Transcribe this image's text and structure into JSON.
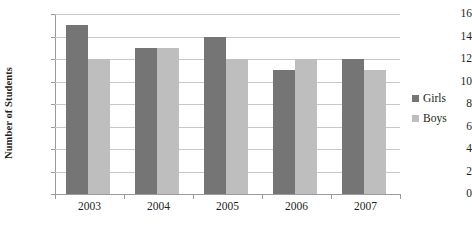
{
  "chart_data": {
    "type": "bar",
    "title": "",
    "xlabel": "",
    "ylabel": "Number of Students",
    "categories": [
      "2003",
      "2004",
      "2005",
      "2006",
      "2007"
    ],
    "series": [
      {
        "name": "Girls",
        "color": "#757575",
        "values": [
          15,
          13,
          14,
          11,
          12
        ]
      },
      {
        "name": "Boys",
        "color": "#bebebe",
        "values": [
          12,
          13,
          12,
          12,
          11
        ]
      }
    ],
    "ylim": [
      0,
      16
    ],
    "ytick_step": 2,
    "yticks": [
      "0",
      "2",
      "4",
      "6",
      "8",
      "10",
      "12",
      "14",
      "16"
    ],
    "grid": true,
    "legend_position": "right"
  },
  "legend": {
    "entries": [
      {
        "label": "Girls",
        "color": "#757575"
      },
      {
        "label": "Boys",
        "color": "#bebebe"
      }
    ]
  },
  "colors": {
    "girls": "#757575",
    "boys": "#bebebe",
    "gridline": "#c8c8c8",
    "axis": "#9a9a9a",
    "background": "#ffffff",
    "text": "#231f20"
  }
}
